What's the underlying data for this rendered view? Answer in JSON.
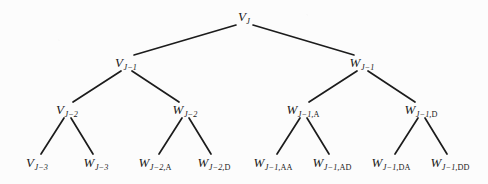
{
  "figure": {
    "type": "tree-diagram",
    "title": "",
    "background_color": "#fcfcfc",
    "line_color": "#1c1c1c",
    "text_color": "#1a1a1a",
    "levels": 4,
    "node_count": 15,
    "edge_count": 14
  },
  "nodes": [
    {
      "id": "n0",
      "level": 0,
      "x": 244,
      "y": 17,
      "base": "V",
      "sub_italic": "J",
      "sub_upright": "",
      "text": "V_J"
    },
    {
      "id": "n1",
      "level": 1,
      "x": 126,
      "y": 63,
      "base": "V",
      "sub_italic": "J−1",
      "sub_upright": "",
      "text": "V_{J-1}"
    },
    {
      "id": "n2",
      "level": 1,
      "x": 362,
      "y": 63,
      "base": "W",
      "sub_italic": "J−1",
      "sub_upright": "",
      "text": "W_{J-1}"
    },
    {
      "id": "n3",
      "level": 2,
      "x": 67,
      "y": 110,
      "base": "V",
      "sub_italic": "J−2",
      "sub_upright": "",
      "text": "V_{J-2}"
    },
    {
      "id": "n4",
      "level": 2,
      "x": 185,
      "y": 110,
      "base": "W",
      "sub_italic": "J−2",
      "sub_upright": "",
      "text": "W_{J-2}"
    },
    {
      "id": "n5",
      "level": 2,
      "x": 303,
      "y": 110,
      "base": "W",
      "sub_italic": "J−1,",
      "sub_upright": "A",
      "text": "W_{J-1,A}"
    },
    {
      "id": "n6",
      "level": 2,
      "x": 421,
      "y": 110,
      "base": "W",
      "sub_italic": "J−1,",
      "sub_upright": "D",
      "text": "W_{J-1,D}"
    },
    {
      "id": "n7",
      "level": 3,
      "x": 37,
      "y": 163,
      "base": "V",
      "sub_italic": "J−3",
      "sub_upright": "",
      "text": "V_{J-3}"
    },
    {
      "id": "n8",
      "level": 3,
      "x": 96,
      "y": 163,
      "base": "W",
      "sub_italic": "J−3",
      "sub_upright": "",
      "text": "W_{J-3}"
    },
    {
      "id": "n9",
      "level": 3,
      "x": 155,
      "y": 163,
      "base": "W",
      "sub_italic": "J−2,",
      "sub_upright": "A",
      "text": "W_{J-2,A}"
    },
    {
      "id": "n10",
      "level": 3,
      "x": 214,
      "y": 163,
      "base": "W",
      "sub_italic": "J−2,",
      "sub_upright": "D",
      "text": "W_{J-2,D}"
    },
    {
      "id": "n11",
      "level": 3,
      "x": 273,
      "y": 163,
      "base": "W",
      "sub_italic": "J−1,",
      "sub_upright": "AA",
      "text": "W_{J-1,AA}"
    },
    {
      "id": "n12",
      "level": 3,
      "x": 332,
      "y": 163,
      "base": "W",
      "sub_italic": "J−1,",
      "sub_upright": "AD",
      "text": "W_{J-1,AD}"
    },
    {
      "id": "n13",
      "level": 3,
      "x": 391,
      "y": 163,
      "base": "W",
      "sub_italic": "J−1,",
      "sub_upright": "DA",
      "text": "W_{J-1,DA}"
    },
    {
      "id": "n14",
      "level": 3,
      "x": 450,
      "y": 163,
      "base": "W",
      "sub_italic": "J−1,",
      "sub_upright": "DD",
      "text": "W_{J-1,DD}"
    }
  ],
  "edges": [
    {
      "from": "n0",
      "to": "n1",
      "x1": 236,
      "y1": 25,
      "x2": 134,
      "y2": 55
    },
    {
      "from": "n0",
      "to": "n2",
      "x1": 253,
      "y1": 25,
      "x2": 354,
      "y2": 55
    },
    {
      "from": "n1",
      "to": "n3",
      "x1": 121,
      "y1": 71,
      "x2": 73,
      "y2": 102
    },
    {
      "from": "n1",
      "to": "n4",
      "x1": 132,
      "y1": 71,
      "x2": 179,
      "y2": 102
    },
    {
      "from": "n2",
      "to": "n5",
      "x1": 357,
      "y1": 71,
      "x2": 309,
      "y2": 102
    },
    {
      "from": "n2",
      "to": "n6",
      "x1": 368,
      "y1": 71,
      "x2": 415,
      "y2": 102
    },
    {
      "from": "n3",
      "to": "n7",
      "x1": 64,
      "y1": 118,
      "x2": 41,
      "y2": 154
    },
    {
      "from": "n3",
      "to": "n8",
      "x1": 71,
      "y1": 118,
      "x2": 93,
      "y2": 154
    },
    {
      "from": "n4",
      "to": "n9",
      "x1": 182,
      "y1": 118,
      "x2": 159,
      "y2": 154
    },
    {
      "from": "n4",
      "to": "n10",
      "x1": 189,
      "y1": 118,
      "x2": 211,
      "y2": 154
    },
    {
      "from": "n5",
      "to": "n11",
      "x1": 300,
      "y1": 118,
      "x2": 277,
      "y2": 154
    },
    {
      "from": "n5",
      "to": "n12",
      "x1": 307,
      "y1": 118,
      "x2": 329,
      "y2": 154
    },
    {
      "from": "n6",
      "to": "n13",
      "x1": 418,
      "y1": 118,
      "x2": 395,
      "y2": 154
    },
    {
      "from": "n6",
      "to": "n14",
      "x1": 425,
      "y1": 118,
      "x2": 447,
      "y2": 154
    }
  ]
}
